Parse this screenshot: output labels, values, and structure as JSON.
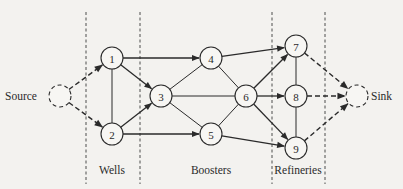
{
  "diagram": {
    "type": "network-flow",
    "colors": {
      "ink": "#2a2a2a",
      "background": "#f3f2ef"
    },
    "endpoints": {
      "source": {
        "label": "Source",
        "x": 60,
        "y": 96
      },
      "sink": {
        "label": "Sink",
        "x": 357,
        "y": 96
      }
    },
    "nodes": [
      {
        "id": "1",
        "label": "1",
        "x": 112,
        "y": 58
      },
      {
        "id": "2",
        "label": "2",
        "x": 112,
        "y": 134
      },
      {
        "id": "3",
        "label": "3",
        "x": 161,
        "y": 96
      },
      {
        "id": "4",
        "label": "4",
        "x": 211,
        "y": 58
      },
      {
        "id": "5",
        "label": "5",
        "x": 211,
        "y": 134
      },
      {
        "id": "6",
        "label": "6",
        "x": 246,
        "y": 96
      },
      {
        "id": "7",
        "label": "7",
        "x": 296,
        "y": 46
      },
      {
        "id": "8",
        "label": "8",
        "x": 296,
        "y": 96
      },
      {
        "id": "9",
        "label": "9",
        "x": 296,
        "y": 148
      }
    ],
    "edges": [
      {
        "from": "source",
        "to": "1",
        "style": "dashed",
        "directed": true
      },
      {
        "from": "source",
        "to": "2",
        "style": "dashed",
        "directed": true
      },
      {
        "from": "1",
        "to": "2",
        "style": "solid",
        "directed": false
      },
      {
        "from": "1",
        "to": "3",
        "style": "solid",
        "directed": true
      },
      {
        "from": "1",
        "to": "4",
        "style": "solid",
        "directed": true
      },
      {
        "from": "2",
        "to": "3",
        "style": "solid",
        "directed": true
      },
      {
        "from": "2",
        "to": "5",
        "style": "solid",
        "directed": true
      },
      {
        "from": "3",
        "to": "4",
        "style": "solid",
        "directed": false
      },
      {
        "from": "3",
        "to": "5",
        "style": "solid",
        "directed": false
      },
      {
        "from": "3",
        "to": "6",
        "style": "solid",
        "directed": false
      },
      {
        "from": "4",
        "to": "6",
        "style": "solid",
        "directed": false
      },
      {
        "from": "5",
        "to": "6",
        "style": "solid",
        "directed": false
      },
      {
        "from": "4",
        "to": "7",
        "style": "solid",
        "directed": true
      },
      {
        "from": "5",
        "to": "9",
        "style": "solid",
        "directed": true
      },
      {
        "from": "6",
        "to": "7",
        "style": "solid",
        "directed": true
      },
      {
        "from": "6",
        "to": "8",
        "style": "solid",
        "directed": true
      },
      {
        "from": "6",
        "to": "9",
        "style": "solid",
        "directed": true
      },
      {
        "from": "7",
        "to": "8",
        "style": "solid",
        "directed": false
      },
      {
        "from": "8",
        "to": "9",
        "style": "solid",
        "directed": false
      },
      {
        "from": "7",
        "to": "sink",
        "style": "dashed",
        "directed": true
      },
      {
        "from": "8",
        "to": "sink",
        "style": "dashed",
        "directed": true
      },
      {
        "from": "9",
        "to": "sink",
        "style": "dashed",
        "directed": true
      }
    ],
    "groups": [
      {
        "label": "Wells",
        "x": 112
      },
      {
        "label": "Boosters",
        "x": 211
      },
      {
        "label": "Refineries",
        "x": 298
      }
    ]
  }
}
